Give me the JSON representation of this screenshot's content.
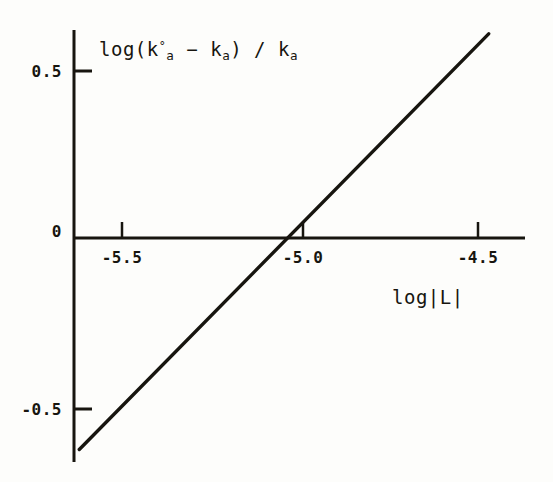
{
  "chart_data": {
    "type": "line",
    "title": "",
    "subtitle": "",
    "xlabel": "log|L|",
    "ylabel": "log(k°a − ka) / ka",
    "ylabel_parts": {
      "prefix": "log(k",
      "sup1": "°",
      "sub1": "a",
      "minus": " − ",
      "k2": "k",
      "sub2": "a",
      "close": ") / k",
      "sub3": "a"
    },
    "xlabel_parts": {
      "text": "log|L|"
    },
    "xlim": [
      -5.62,
      -4.38
    ],
    "ylim": [
      -0.62,
      0.62
    ],
    "xticks": [
      -5.5,
      -5.0,
      -4.5
    ],
    "xtick_labels": [
      "-5.5",
      "-5.0",
      "-4.5"
    ],
    "yticks": [
      0.5,
      0,
      -0.5
    ],
    "ytick_labels": [
      "0.5",
      "0",
      "-0.5"
    ],
    "grid": false,
    "legend": null,
    "axis_style": "two-spine (left y-axis, horizontal x-axis at y=0)",
    "tick_direction": {
      "x": "outward-up (above axis line)",
      "y": "outward-right (right of axis line)"
    },
    "series": [
      {
        "name": "linear fit",
        "type": "line",
        "color": "#17150f",
        "linewidth": 3,
        "points": [
          {
            "x": -5.62,
            "y": -0.62
          },
          {
            "x": -4.47,
            "y": 0.61
          }
        ],
        "x_intercept": -5.05,
        "slope": 1.07,
        "annotation": ""
      }
    ]
  },
  "geometry": {
    "y_axis_x": 74,
    "x_axis_y": 238,
    "y_axis_top": 30,
    "y_axis_bottom": 462,
    "x_axis_left": 74,
    "x_axis_right": 525,
    "xtick_px": [
      122,
      303,
      478
    ],
    "ytick_px": [
      71,
      238,
      409
    ],
    "line_px": [
      [
        78,
        444
      ],
      [
        490,
        41
      ]
    ],
    "ytick_len": 16,
    "xtick_len": 14
  },
  "style": {
    "background": "#fdfdfb",
    "ink": "#17150f",
    "axis_width": 3,
    "line_width": 3
  },
  "labels": {
    "y_axis_title_pos": {
      "x": 99,
      "y": 52
    },
    "x_axis_title_pos": {
      "x": 392,
      "y": 302
    },
    "ytick_label_pos": [
      {
        "x": 62,
        "y": 71
      },
      {
        "x": 62,
        "y": 231
      },
      {
        "x": 62,
        "y": 409
      }
    ],
    "xtick_label_pos": [
      {
        "x": 122,
        "y": 248
      },
      {
        "x": 303,
        "y": 248
      },
      {
        "x": 478,
        "y": 248
      }
    ]
  }
}
